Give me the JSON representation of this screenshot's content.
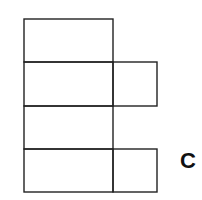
{
  "diagram": {
    "label": "C",
    "stroke_color": "#222222",
    "background": "#ffffff"
  }
}
